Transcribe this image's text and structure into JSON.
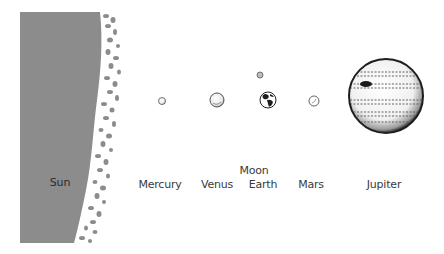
{
  "diagram": {
    "colors": {
      "sun_fill": "#8c8c8c",
      "planet_outline": "#333333",
      "label_text": "#3a3a3a",
      "background": "#ffffff"
    },
    "bodies": [
      {
        "id": "sun",
        "label": "Sun",
        "shape": "partial-disk-edge",
        "icon": "sun-limb-icon"
      },
      {
        "id": "mercury",
        "label": "Mercury",
        "shape": "circle",
        "cx": 162,
        "cy": 101,
        "r": 3.5,
        "icon": "mercury-icon"
      },
      {
        "id": "venus",
        "label": "Venus",
        "shape": "circle",
        "cx": 217,
        "cy": 100,
        "r": 7,
        "icon": "venus-icon"
      },
      {
        "id": "moon",
        "label": "Moon",
        "shape": "circle",
        "cx": 260,
        "cy": 75,
        "r": 3,
        "icon": "moon-icon"
      },
      {
        "id": "earth",
        "label": "Earth",
        "shape": "circle",
        "cx": 268,
        "cy": 100,
        "r": 8,
        "icon": "earth-icon"
      },
      {
        "id": "mars",
        "label": "Mars",
        "shape": "circle",
        "cx": 314,
        "cy": 101,
        "r": 5,
        "icon": "mars-icon"
      },
      {
        "id": "jupiter",
        "label": "Jupiter",
        "shape": "circle",
        "cx": 386,
        "cy": 96,
        "r": 37,
        "icon": "jupiter-icon"
      }
    ],
    "labels": {
      "sun": "Sun",
      "mercury": "Mercury",
      "venus": "Venus",
      "moon": "Moon",
      "earth": "Earth",
      "mars": "Mars",
      "jupiter": "Jupiter"
    }
  }
}
